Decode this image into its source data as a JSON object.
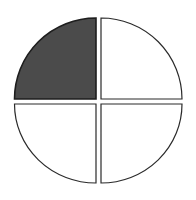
{
  "diagram": {
    "type": "fraction-circle",
    "total_parts": 4,
    "shaded_parts": 1,
    "fraction": "1/4",
    "colors": {
      "shaded_fill": "#4b4b4b",
      "unshaded_fill": "#ffffff",
      "stroke": "#2a2a2a",
      "background": "#ffffff"
    },
    "quadrants": [
      {
        "position": "top-left",
        "shaded": true
      },
      {
        "position": "top-right",
        "shaded": false
      },
      {
        "position": "bottom-left",
        "shaded": false
      },
      {
        "position": "bottom-right",
        "shaded": false
      }
    ]
  }
}
